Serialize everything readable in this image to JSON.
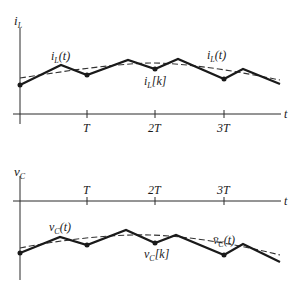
{
  "top_plot": {
    "y_axis_label": "i",
    "y_axis_label_sub": "L",
    "x_axis_label": "t",
    "ticks": [
      "T",
      "2T",
      "3T"
    ],
    "waveform_label": {
      "main": "i",
      "sub": "L",
      "arg": "(t)"
    },
    "sample_label": {
      "main": "i",
      "sub": "L",
      "arg": "[k]"
    },
    "average_label": {
      "main": "i",
      "sub": "L",
      "arg": "(t)"
    }
  },
  "bottom_plot": {
    "y_axis_label": "v",
    "y_axis_label_sub": "C",
    "x_axis_label": "t",
    "ticks": [
      "T",
      "2T",
      "3T"
    ],
    "waveform_label": {
      "main": "v",
      "sub": "C",
      "arg": "(t)"
    },
    "sample_label": {
      "main": "v",
      "sub": "C",
      "arg": "[k]"
    },
    "average_label": {
      "main": "v̄",
      "sub": "C",
      "arg": "(t)"
    }
  }
}
